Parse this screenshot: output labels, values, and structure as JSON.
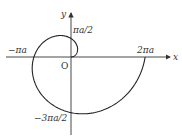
{
  "diagram": {
    "type": "archimedean-spiral",
    "equation": "r = a·θ",
    "axes": {
      "x_label": "x",
      "y_label": "y",
      "origin_label": "O"
    },
    "tick_labels": {
      "pos_y": "πa/2",
      "neg_x": "−πa",
      "pos_x": "2πa",
      "neg_y": "−3πa/2"
    },
    "theta_range": [
      0,
      6.2832
    ],
    "colors": {
      "curve": "#222222",
      "axis": "#333333"
    }
  }
}
